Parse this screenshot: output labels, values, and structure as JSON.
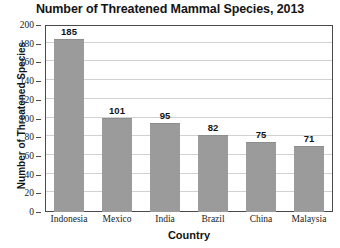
{
  "chart_data": {
    "type": "bar",
    "title": "Number of Threatened Mammal Species, 2013",
    "xlabel": "Country",
    "ylabel": "Number of Threatened Species",
    "categories": [
      "Indonesia",
      "Mexico",
      "India",
      "Brazil",
      "China",
      "Malaysia"
    ],
    "values": [
      185,
      101,
      95,
      82,
      75,
      71
    ],
    "ylim": [
      0,
      200
    ],
    "ytick_step": 20,
    "yticks": [
      0,
      20,
      40,
      60,
      80,
      100,
      120,
      140,
      160,
      180,
      200
    ],
    "grid": true,
    "legend": null,
    "bar_color": "#9b9b9b",
    "gridline_color": "#d2d2d2",
    "axis_color": "#4a4a4a",
    "text_color": "#141414",
    "data_labels_shown": true
  }
}
